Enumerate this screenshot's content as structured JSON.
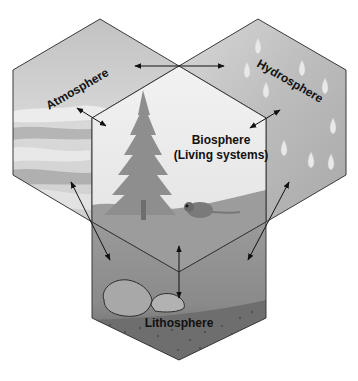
{
  "diagram": {
    "type": "earth-systems-interaction",
    "spheres": [
      {
        "id": "atmosphere",
        "label": "Atmosphere",
        "position": "upper-left"
      },
      {
        "id": "hydrosphere",
        "label": "Hydrosphere",
        "position": "upper-right"
      },
      {
        "id": "biosphere",
        "label_line1": "Biosphere",
        "label_line2": "(Living systems)",
        "position": "center"
      },
      {
        "id": "lithosphere",
        "label": "Lithosphere",
        "position": "bottom"
      }
    ],
    "interactions": [
      {
        "from": "atmosphere",
        "to": "hydrosphere",
        "kind": "double-arrow"
      },
      {
        "from": "atmosphere",
        "to": "biosphere",
        "kind": "double-arrow"
      },
      {
        "from": "hydrosphere",
        "to": "biosphere",
        "kind": "double-arrow"
      },
      {
        "from": "atmosphere",
        "to": "lithosphere",
        "kind": "double-arrow"
      },
      {
        "from": "hydrosphere",
        "to": "lithosphere",
        "kind": "double-arrow"
      },
      {
        "from": "biosphere",
        "to": "lithosphere",
        "kind": "double-arrow"
      }
    ],
    "colors": {
      "outline": "#3a3a3a",
      "atmosphere_fill": "#c8c8c8",
      "hydrosphere_fill": "#bdbdbd",
      "biosphere_fill": "#eeeeee",
      "lithosphere_fill": "#8a8a8a",
      "arrow": "#111111"
    }
  },
  "caption": {
    "text": "",
    "note": "truncated"
  }
}
